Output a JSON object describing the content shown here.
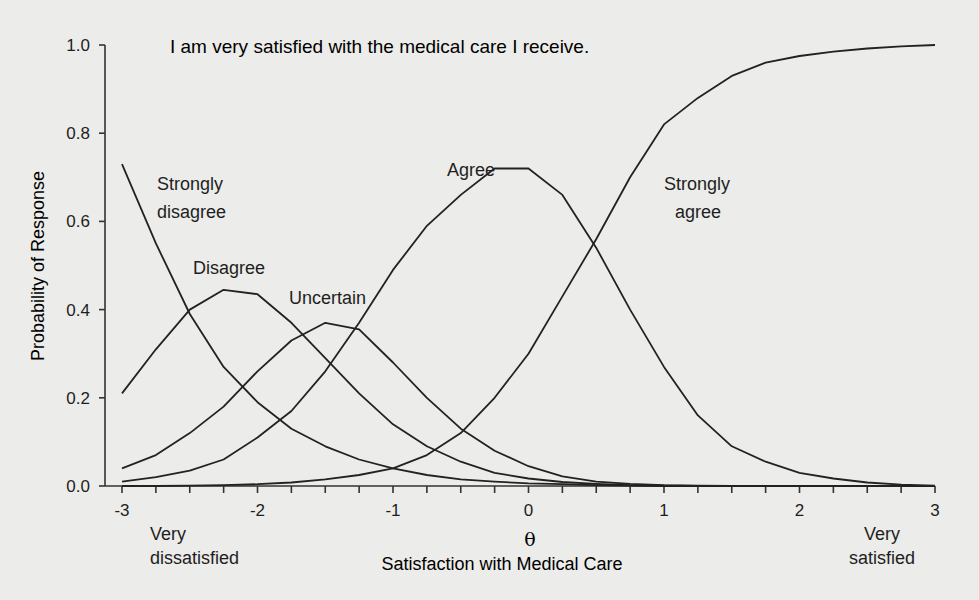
{
  "chart_data": {
    "type": "line",
    "title": "I am very satisfied with the medical care I receive.",
    "xlabel": "Satisfaction with Medical Care",
    "xlabel_symbol": "θ",
    "ylabel": "Probability of Response",
    "xlim": [
      -3,
      3
    ],
    "ylim": [
      0,
      1.0
    ],
    "x_ticks": [
      -3,
      -2,
      -1,
      0,
      1,
      2,
      3
    ],
    "x_tick_labels": [
      "-3",
      "-2",
      "-1",
      "0",
      "1",
      "2",
      "3"
    ],
    "y_ticks": [
      0.0,
      0.2,
      0.4,
      0.6,
      0.8,
      1.0
    ],
    "y_tick_labels": [
      "0.0",
      "0.2",
      "0.4",
      "0.6",
      "0.8",
      "1.0"
    ],
    "x_minor_tick_step": 0.25,
    "grid": false,
    "legend": "inline curve labels",
    "axis_annotations": {
      "left": "Very dissatisfied",
      "right": "Very satisfied"
    },
    "x": [
      -3,
      -2.75,
      -2.5,
      -2.25,
      -2,
      -1.75,
      -1.5,
      -1.25,
      -1,
      -0.75,
      -0.5,
      -0.25,
      0,
      0.25,
      0.5,
      0.75,
      1,
      1.25,
      1.5,
      1.75,
      2,
      2.25,
      2.5,
      2.75,
      3
    ],
    "series": [
      {
        "name": "Strongly disagree",
        "label_lines": [
          "Strongly",
          "disagree"
        ],
        "values": [
          0.73,
          0.55,
          0.39,
          0.27,
          0.19,
          0.13,
          0.09,
          0.06,
          0.04,
          0.025,
          0.015,
          0.01,
          0.006,
          0.004,
          0.002,
          0.001,
          0.0,
          0.0,
          0.0,
          0.0,
          0.0,
          0.0,
          0.0,
          0.0,
          0.0
        ]
      },
      {
        "name": "Disagree",
        "label_lines": [
          "Disagree"
        ],
        "values": [
          0.21,
          0.31,
          0.4,
          0.445,
          0.435,
          0.37,
          0.29,
          0.21,
          0.14,
          0.09,
          0.055,
          0.03,
          0.017,
          0.009,
          0.005,
          0.002,
          0.001,
          0.0,
          0.0,
          0.0,
          0.0,
          0.0,
          0.0,
          0.0,
          0.0
        ]
      },
      {
        "name": "Uncertain",
        "label_lines": [
          "Uncertain"
        ],
        "values": [
          0.04,
          0.07,
          0.12,
          0.18,
          0.26,
          0.33,
          0.37,
          0.355,
          0.28,
          0.2,
          0.13,
          0.08,
          0.045,
          0.022,
          0.01,
          0.005,
          0.002,
          0.001,
          0.0,
          0.0,
          0.0,
          0.0,
          0.0,
          0.0,
          0.0
        ]
      },
      {
        "name": "Agree",
        "label_lines": [
          "Agree"
        ],
        "values": [
          0.01,
          0.02,
          0.035,
          0.06,
          0.11,
          0.17,
          0.26,
          0.37,
          0.49,
          0.59,
          0.66,
          0.72,
          0.72,
          0.66,
          0.54,
          0.4,
          0.27,
          0.16,
          0.09,
          0.055,
          0.03,
          0.017,
          0.008,
          0.003,
          0.001
        ]
      },
      {
        "name": "Strongly agree",
        "label_lines": [
          "Strongly",
          "agree"
        ],
        "values": [
          0.0,
          0.0,
          0.001,
          0.002,
          0.004,
          0.008,
          0.015,
          0.025,
          0.04,
          0.07,
          0.12,
          0.2,
          0.3,
          0.43,
          0.56,
          0.7,
          0.82,
          0.88,
          0.93,
          0.96,
          0.975,
          0.985,
          0.992,
          0.997,
          1.0
        ]
      }
    ]
  }
}
